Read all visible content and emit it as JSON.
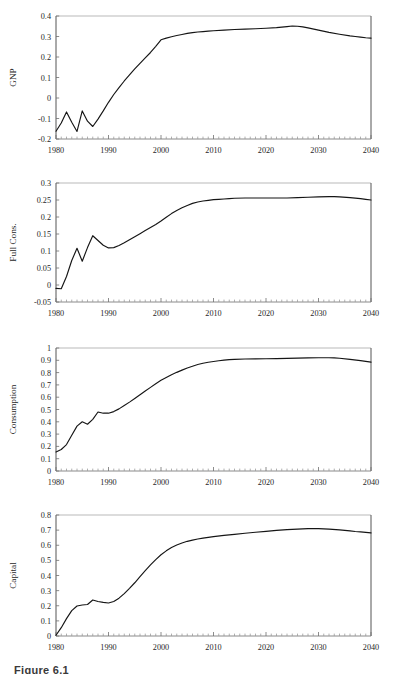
{
  "figure": {
    "caption": "Figure 6.1",
    "panel_count": 4
  },
  "chart_data": [
    {
      "type": "line",
      "title": "",
      "ylabel": "GNP",
      "xlabel": "",
      "xlim": [
        1980,
        2040
      ],
      "ylim": [
        -0.2,
        0.4
      ],
      "yticks": [
        "0.4",
        "0.3",
        "0.2",
        "0.1",
        "0",
        "-0.1",
        "-0.2"
      ],
      "ytickvals": [
        0.4,
        0.3,
        0.2,
        0.1,
        0,
        -0.1,
        -0.2
      ],
      "xticks": [
        "1980",
        "1990",
        "2000",
        "2010",
        "2020",
        "2030",
        "2040"
      ],
      "xtickvals": [
        1980,
        1990,
        2000,
        2010,
        2020,
        2030,
        2040
      ],
      "grid": false,
      "legend": "none",
      "minor_tick_interval": 1,
      "series": [
        {
          "name": "GNP",
          "x": [
            1980,
            1981,
            1982,
            1983,
            1984,
            1985,
            1986,
            1987,
            1988,
            1989,
            1990,
            1991,
            1992,
            1993,
            1994,
            1995,
            1996,
            1997,
            1998,
            1999,
            2000,
            2001,
            2002,
            2003,
            2004,
            2005,
            2006,
            2007,
            2008,
            2009,
            2010,
            2012,
            2014,
            2016,
            2018,
            2020,
            2022,
            2024,
            2025,
            2026,
            2027,
            2028,
            2030,
            2032,
            2034,
            2036,
            2037,
            2038,
            2039,
            2040
          ],
          "values": [
            -0.162,
            -0.122,
            -0.068,
            -0.118,
            -0.163,
            -0.063,
            -0.113,
            -0.139,
            -0.103,
            -0.063,
            -0.021,
            0.017,
            0.051,
            0.083,
            0.113,
            0.142,
            0.169,
            0.196,
            0.222,
            0.252,
            0.284,
            0.292,
            0.299,
            0.305,
            0.31,
            0.315,
            0.319,
            0.322,
            0.324,
            0.326,
            0.328,
            0.331,
            0.334,
            0.336,
            0.338,
            0.34,
            0.343,
            0.348,
            0.351,
            0.35,
            0.347,
            0.342,
            0.331,
            0.32,
            0.311,
            0.303,
            0.3,
            0.297,
            0.294,
            0.292
          ]
        }
      ]
    },
    {
      "type": "line",
      "title": "",
      "ylabel": "Full Cons.",
      "xlabel": "",
      "xlim": [
        1980,
        2040
      ],
      "ylim": [
        -0.05,
        0.3
      ],
      "yticks": [
        "0.3",
        "0.25",
        "0.2",
        "0.15",
        "0.1",
        "0.05",
        "0",
        "-0.05"
      ],
      "ytickvals": [
        0.3,
        0.25,
        0.2,
        0.15,
        0.1,
        0.05,
        0,
        -0.05
      ],
      "xticks": [
        "1980",
        "1990",
        "2000",
        "2010",
        "2020",
        "2030",
        "2040"
      ],
      "xtickvals": [
        1980,
        1990,
        2000,
        2010,
        2020,
        2030,
        2040
      ],
      "grid": false,
      "legend": "none",
      "minor_tick_interval": 1,
      "series": [
        {
          "name": "Full Cons.",
          "x": [
            1980,
            1981,
            1982,
            1983,
            1984,
            1985,
            1986,
            1987,
            1988,
            1989,
            1990,
            1991,
            1992,
            1993,
            1994,
            1995,
            1996,
            1997,
            1998,
            1999,
            2000,
            2001,
            2002,
            2003,
            2004,
            2005,
            2006,
            2007,
            2008,
            2009,
            2010,
            2011,
            2012,
            2013,
            2014,
            2016,
            2018,
            2020,
            2022,
            2024,
            2026,
            2028,
            2030,
            2032,
            2033,
            2034,
            2036,
            2038,
            2039,
            2040
          ],
          "values": [
            -0.01,
            -0.011,
            0.025,
            0.072,
            0.108,
            0.07,
            0.11,
            0.145,
            0.131,
            0.117,
            0.109,
            0.11,
            0.116,
            0.124,
            0.133,
            0.142,
            0.151,
            0.16,
            0.169,
            0.178,
            0.188,
            0.199,
            0.21,
            0.219,
            0.227,
            0.234,
            0.24,
            0.244,
            0.247,
            0.249,
            0.251,
            0.252,
            0.253,
            0.254,
            0.255,
            0.256,
            0.256,
            0.256,
            0.256,
            0.256,
            0.257,
            0.258,
            0.259,
            0.26,
            0.26,
            0.259,
            0.257,
            0.254,
            0.252,
            0.25
          ]
        }
      ]
    },
    {
      "type": "line",
      "title": "",
      "ylabel": "Consumption",
      "xlabel": "",
      "xlim": [
        1980,
        2040
      ],
      "ylim": [
        0,
        1
      ],
      "yticks": [
        "1",
        "0.9",
        "0.8",
        "0.7",
        "0.6",
        "0.5",
        "0.4",
        "0.3",
        "0.2",
        "0.1",
        "0"
      ],
      "ytickvals": [
        1,
        0.9,
        0.8,
        0.7,
        0.6,
        0.5,
        0.4,
        0.3,
        0.2,
        0.1,
        0
      ],
      "xticks": [
        "1980",
        "1990",
        "2000",
        "2010",
        "2020",
        "2030",
        "2040"
      ],
      "xtickvals": [
        1980,
        1990,
        2000,
        2010,
        2020,
        2030,
        2040
      ],
      "grid": false,
      "legend": "none",
      "minor_tick_interval": 1,
      "series": [
        {
          "name": "Consumption",
          "x": [
            1980,
            1981,
            1982,
            1983,
            1984,
            1985,
            1986,
            1987,
            1988,
            1989,
            1990,
            1991,
            1992,
            1993,
            1994,
            1995,
            1996,
            1997,
            1998,
            1999,
            2000,
            2001,
            2002,
            2003,
            2004,
            2005,
            2006,
            2007,
            2008,
            2009,
            2010,
            2011,
            2012,
            2013,
            2014,
            2016,
            2018,
            2020,
            2022,
            2024,
            2026,
            2028,
            2030,
            2032,
            2033,
            2034,
            2036,
            2038,
            2039,
            2040
          ],
          "values": [
            0.155,
            0.175,
            0.215,
            0.29,
            0.365,
            0.4,
            0.38,
            0.42,
            0.48,
            0.47,
            0.47,
            0.483,
            0.505,
            0.532,
            0.56,
            0.59,
            0.62,
            0.65,
            0.68,
            0.71,
            0.737,
            0.76,
            0.782,
            0.802,
            0.82,
            0.838,
            0.852,
            0.866,
            0.876,
            0.884,
            0.89,
            0.896,
            0.901,
            0.905,
            0.908,
            0.911,
            0.912,
            0.913,
            0.914,
            0.916,
            0.918,
            0.92,
            0.921,
            0.921,
            0.92,
            0.917,
            0.908,
            0.897,
            0.891,
            0.885
          ]
        }
      ]
    },
    {
      "type": "line",
      "title": "",
      "ylabel": "Capital",
      "xlabel": "",
      "xlim": [
        1980,
        2040
      ],
      "ylim": [
        0,
        0.8
      ],
      "yticks": [
        "0.8",
        "0.7",
        "0.6",
        "0.5",
        "0.4",
        "0.3",
        "0.2",
        "0.1",
        "0"
      ],
      "ytickvals": [
        0.8,
        0.7,
        0.6,
        0.5,
        0.4,
        0.3,
        0.2,
        0.1,
        0
      ],
      "xticks": [
        "1980",
        "1990",
        "2000",
        "2010",
        "2020",
        "2030",
        "2040"
      ],
      "xtickvals": [
        1980,
        1990,
        2000,
        2010,
        2020,
        2030,
        2040
      ],
      "grid": false,
      "legend": "none",
      "minor_tick_interval": 1,
      "series": [
        {
          "name": "Capital",
          "x": [
            1980,
            1981,
            1982,
            1983,
            1984,
            1985,
            1986,
            1987,
            1988,
            1989,
            1990,
            1991,
            1992,
            1993,
            1994,
            1995,
            1996,
            1997,
            1998,
            1999,
            2000,
            2001,
            2002,
            2003,
            2004,
            2005,
            2006,
            2007,
            2008,
            2009,
            2010,
            2012,
            2014,
            2016,
            2018,
            2020,
            2022,
            2024,
            2026,
            2028,
            2029,
            2030,
            2032,
            2034,
            2036,
            2037,
            2038,
            2039,
            2040
          ],
          "values": [
            0.005,
            0.055,
            0.115,
            0.168,
            0.198,
            0.205,
            0.208,
            0.238,
            0.228,
            0.222,
            0.218,
            0.228,
            0.25,
            0.28,
            0.315,
            0.352,
            0.392,
            0.432,
            0.47,
            0.505,
            0.537,
            0.563,
            0.585,
            0.602,
            0.615,
            0.626,
            0.634,
            0.641,
            0.647,
            0.652,
            0.657,
            0.665,
            0.672,
            0.679,
            0.686,
            0.692,
            0.698,
            0.703,
            0.707,
            0.71,
            0.711,
            0.71,
            0.707,
            0.702,
            0.695,
            0.691,
            0.688,
            0.685,
            0.682
          ]
        }
      ]
    }
  ],
  "panel_geometry": [
    {
      "top": 8,
      "height": 162
    },
    {
      "top": 175,
      "height": 158
    },
    {
      "top": 340,
      "height": 162
    },
    {
      "top": 507,
      "height": 160
    }
  ]
}
